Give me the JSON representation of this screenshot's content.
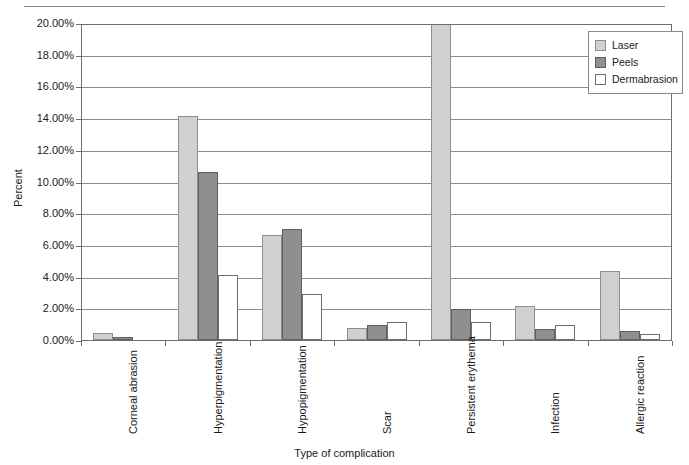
{
  "chart_data": {
    "type": "bar",
    "title": "",
    "xlabel": "Type of complication",
    "ylabel": "Percent",
    "ylim": [
      0,
      20
    ],
    "ytick_labels": [
      "0.00%",
      "2.00%",
      "4.00%",
      "6.00%",
      "8.00%",
      "10.00%",
      "12.00%",
      "14.00%",
      "16.00%",
      "18.00%",
      "20.00%"
    ],
    "ytick_values": [
      0,
      2,
      4,
      6,
      8,
      10,
      12,
      14,
      16,
      18,
      20
    ],
    "grid": "horizontal",
    "legend_position": "top-right",
    "categories": [
      "Corneal abrasion",
      "Hyperpigmentation",
      "Hypopigmentation",
      "Scar",
      "Persistent erythema",
      "Infection",
      "Allergic reaction"
    ],
    "series": [
      {
        "name": "Laser",
        "color": "#d0d0d0",
        "values": [
          0.3,
          14.0,
          6.5,
          0.65,
          20.0,
          2.05,
          4.2
        ],
        "clipped": [
          false,
          false,
          false,
          false,
          true,
          false,
          false
        ]
      },
      {
        "name": "Peels",
        "color": "#8f8f8f",
        "values": [
          0.05,
          10.5,
          6.9,
          0.85,
          1.85,
          0.55,
          0.45
        ],
        "clipped": [
          false,
          false,
          false,
          false,
          false,
          false,
          false
        ]
      },
      {
        "name": "Dermabrasion",
        "color": "#ffffff",
        "values": [
          0.0,
          4.0,
          2.75,
          1.0,
          1.0,
          0.8,
          0.25
        ],
        "clipped": [
          false,
          false,
          false,
          false,
          false,
          false,
          false
        ]
      }
    ]
  },
  "legend": {
    "entries": [
      {
        "label": "Laser",
        "swatch": "laser"
      },
      {
        "label": "Peels",
        "swatch": "peels"
      },
      {
        "label": "Dermabrasion",
        "swatch": "derm"
      }
    ]
  },
  "axes": {
    "y_title": "Percent",
    "x_title": "Type of complication"
  }
}
